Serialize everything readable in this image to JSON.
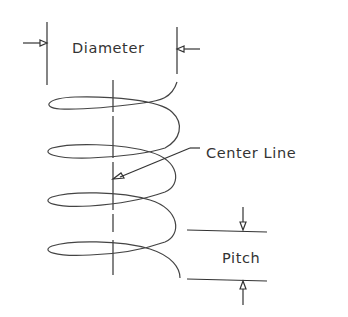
{
  "diagram": {
    "labels": {
      "diameter": "Diameter",
      "center_line": "Center Line",
      "pitch": "Pitch"
    },
    "colors": {
      "line": "#333333",
      "background": "#ffffff"
    },
    "coils": 4
  }
}
